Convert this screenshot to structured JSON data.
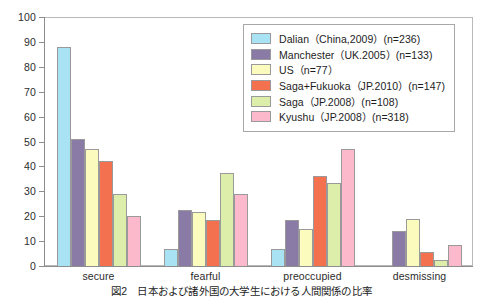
{
  "chart_data": {
    "type": "bar",
    "title": "",
    "xlabel": "",
    "ylabel": "",
    "ylim": [
      0,
      100
    ],
    "yticks": [
      0,
      10,
      20,
      30,
      40,
      50,
      60,
      70,
      80,
      90,
      100
    ],
    "grid": false,
    "legend_position": "top-right",
    "categories": [
      "secure",
      "fearful",
      "preoccupied",
      "desmissing"
    ],
    "series": [
      {
        "name": "Dalian（China,2009）(n=236)",
        "color": "#a9e2f3",
        "values": [
          88,
          7,
          7,
          0
        ]
      },
      {
        "name": "Manchester（UK.2005）(n=133)",
        "color": "#8a7aa6",
        "values": [
          51,
          22.5,
          18.5,
          14
        ]
      },
      {
        "name": "US（n=77）",
        "color": "#fbfbbd",
        "values": [
          47,
          21.5,
          15,
          19
        ]
      },
      {
        "name": "Saga+Fukuoka（JP.2010）(n=147)",
        "color": "#f4714f",
        "values": [
          42,
          18.5,
          36,
          5.5
        ]
      },
      {
        "name": "Saga（JP.2008）(n=108)",
        "color": "#ddeeab",
        "values": [
          29,
          37.5,
          33.5,
          2.5
        ]
      },
      {
        "name": "Kyushu（JP.2008）(n=318)",
        "color": "#fbb9cb",
        "values": [
          20,
          29,
          47,
          8.5
        ]
      }
    ]
  },
  "caption": {
    "number": "図2",
    "text": "日本および諸外国の大学生における人間関係の比率"
  }
}
